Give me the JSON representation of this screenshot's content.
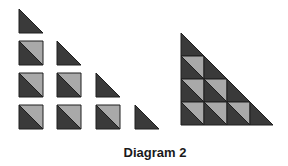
{
  "caption": "Diagram 2",
  "colors": {
    "dark": "#3a3a3a",
    "light": "#a9a9a9",
    "stroke": "#1e1e1e",
    "background": "#ffffff"
  },
  "left_figure": {
    "description": "Staircase of separate pieces: each column has a half-square triangle on top of full squares split diagonally",
    "columns": [
      {
        "triangles": 1,
        "squares": 3
      },
      {
        "triangles": 1,
        "squares": 2
      },
      {
        "triangles": 1,
        "squares": 1
      },
      {
        "triangles": 1,
        "squares": 0
      }
    ]
  },
  "right_figure": {
    "description": "Same pieces assembled into one large right triangle with 4 rows",
    "rows": 4
  }
}
